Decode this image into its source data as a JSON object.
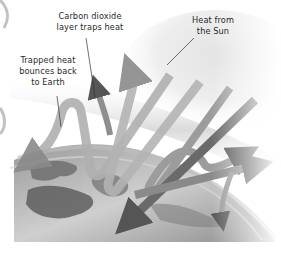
{
  "diagram": {
    "topic": "Greenhouse effect",
    "labels": {
      "co2_layer": [
        "Carbon dioxide",
        "layer traps heat"
      ],
      "sun_heat": [
        "Heat from",
        "the Sun"
      ],
      "trapped_heat": [
        "Trapped heat",
        "bounces back",
        "to Earth"
      ]
    },
    "elements": [
      {
        "name": "sun",
        "description": "Pale sun glow in upper right"
      },
      {
        "name": "carbon-dioxide-layer",
        "description": "Blurred gray band across the sky"
      },
      {
        "name": "earth",
        "description": "Curved grayscale Earth surface at bottom"
      },
      {
        "name": "heat-arrows",
        "description": "Gray arrows descending from the Sun, bouncing off Earth, some escaping and some reflected back by the CO2 layer"
      }
    ],
    "colors": {
      "background": "#ffffff",
      "arrow_light": "#b8b8b8",
      "arrow_dark": "#5a5a5a",
      "earth_land": "#6e6e6e",
      "earth_sea": "#c8c8c8",
      "text": "#2a2a2a"
    }
  }
}
